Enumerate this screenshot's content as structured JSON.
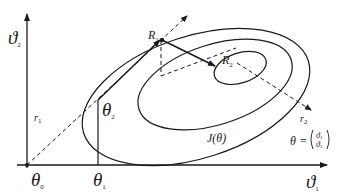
{
  "diagram": {
    "axes": {
      "x_label": "ϑ",
      "x_label_sub": "1",
      "y_label": "ϑ",
      "y_label_sub": "2"
    },
    "points": {
      "origin": {
        "label": "θ",
        "sub": "0"
      },
      "theta1": {
        "label": "θ",
        "sub": "1"
      },
      "theta2": {
        "label": "θ",
        "sub": "2"
      },
      "R1": {
        "label": "R",
        "sub": "1"
      },
      "R2": {
        "label": "R",
        "sub": "2"
      }
    },
    "lines": {
      "r1": {
        "label": "r",
        "sub": "1"
      },
      "r2": {
        "label": "r",
        "sub": "2"
      }
    },
    "contour_label": "J(θ)",
    "vector_def": {
      "lhs": "θ",
      "eq": "=",
      "top": "ϑ",
      "top_sub": "1",
      "bottom": "ϑ",
      "bottom_sub": "2"
    },
    "colors": {
      "stroke": "#1a1a1a",
      "background": "#ffffff"
    }
  }
}
